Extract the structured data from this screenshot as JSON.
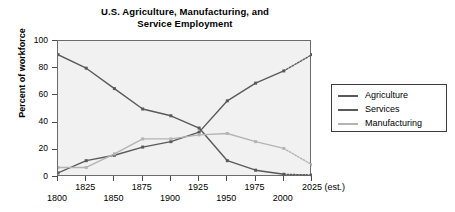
{
  "chart_data": {
    "type": "line",
    "title": "U.S. Agriculture, Manufacturing, and Service Employment",
    "title_line1": "U.S. Agriculture, Manufacturing, and",
    "title_line2": "Service Employment",
    "xlabel": "",
    "ylabel": "Percent of workforce",
    "ylim": [
      0,
      100
    ],
    "xlim": [
      1800,
      2025
    ],
    "grid": false,
    "legend_position": "right",
    "y_ticks": [
      0,
      20,
      40,
      60,
      80,
      100
    ],
    "y_tick_labels": [
      "0",
      "20",
      "40",
      "60",
      "80",
      "100"
    ],
    "x_tick_values": [
      1800,
      1825,
      1850,
      1875,
      1900,
      1925,
      1950,
      1975,
      2000,
      2025
    ],
    "x_tick_labels": [
      "1800",
      "1825",
      "1850",
      "1875",
      "1900",
      "1925",
      "1950",
      "1975",
      "2000",
      "2025 (est.)"
    ],
    "x": [
      1800,
      1825,
      1850,
      1875,
      1900,
      1925,
      1950,
      1975,
      2000,
      2025
    ],
    "series": [
      {
        "name": "Agriculture",
        "color": "#595959",
        "values": [
          90,
          80,
          65,
          50,
          45,
          36,
          12,
          5,
          2,
          1.5
        ],
        "estimated_from": 2000
      },
      {
        "name": "Services",
        "color": "#595959",
        "values": [
          3,
          12,
          16,
          22,
          26,
          33,
          56,
          69,
          78,
          90
        ],
        "estimated_from": 2000
      },
      {
        "name": "Manufacturing",
        "color": "#b4b4b4",
        "values": [
          7,
          7,
          17,
          28,
          28,
          31,
          32,
          26,
          21,
          9
        ],
        "estimated_from": 2000
      }
    ],
    "dense_x": [
      1800,
      1812.5,
      1825,
      1837.5,
      1850,
      1862.5,
      1875,
      1887.5,
      1900,
      1912.5,
      1925,
      1937.5,
      1950,
      1962.5,
      1975,
      1987.5,
      2000,
      2012.5,
      2025
    ],
    "dense_series": [
      {
        "name": "Agriculture",
        "values": [
          90,
          80,
          65,
          50,
          45,
          36,
          12,
          5,
          2,
          1.5,
          null,
          null,
          null,
          null,
          null,
          null,
          null,
          null,
          null
        ]
      },
      {
        "name": "Services",
        "values": [
          3,
          12,
          16,
          22,
          26,
          33,
          56,
          69,
          78,
          90,
          null,
          null,
          null,
          null,
          null,
          null,
          null,
          null,
          null
        ]
      },
      {
        "name": "Manufacturing",
        "values": [
          7,
          7,
          17,
          28,
          28,
          31,
          32,
          26,
          21,
          9,
          null,
          null,
          null,
          null,
          null,
          null,
          null,
          null,
          null
        ]
      }
    ]
  },
  "legend": {
    "items": [
      {
        "label": "Agriculture",
        "color": "#595959"
      },
      {
        "label": "Services",
        "color": "#595959"
      },
      {
        "label": "Manufacturing",
        "color": "#b4b4b4"
      }
    ]
  },
  "colors": {
    "plot_background": "#f1f1f1",
    "axis": "#6b6b6b",
    "dark_line": "#595959",
    "light_line": "#b4b4b4",
    "text": "#000000",
    "page_background": "#ffffff"
  }
}
